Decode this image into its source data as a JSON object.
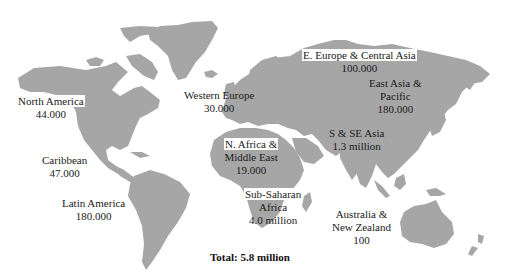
{
  "map": {
    "land_color": "#a6a6a6",
    "background_color": "#ffffff",
    "text_color": "#1a1a1a"
  },
  "regions": [
    {
      "id": "north-america",
      "name": "North America",
      "value": "44.000"
    },
    {
      "id": "caribbean",
      "name": "Caribbean",
      "value": "47.000"
    },
    {
      "id": "latin-america",
      "name": "Latin America",
      "value": "180.000"
    },
    {
      "id": "western-europe",
      "name": "Western Europe",
      "value": "30.000"
    },
    {
      "id": "e-europe-central-asia",
      "name": "E. Europe & Central Asia",
      "value": "100.000"
    },
    {
      "id": "east-asia-pacific",
      "name_line1": "East Asia &",
      "name_line2": "Pacific",
      "value": "180.000"
    },
    {
      "id": "n-africa-middle-east",
      "name_line1": "N. Africa &",
      "name_line2": "Middle East",
      "value": "19.000"
    },
    {
      "id": "s-se-asia",
      "name": "S & SE Asia",
      "value": "1.3 million"
    },
    {
      "id": "sub-saharan-africa",
      "name_line1": "Sub-Saharan",
      "name_line2": "Africa",
      "value": "4.0 million"
    },
    {
      "id": "australia-nz",
      "name_line1": "Australia &",
      "name_line2": "New Zealand",
      "value": "100"
    }
  ],
  "total": {
    "label": "Total: 5.8 million"
  }
}
